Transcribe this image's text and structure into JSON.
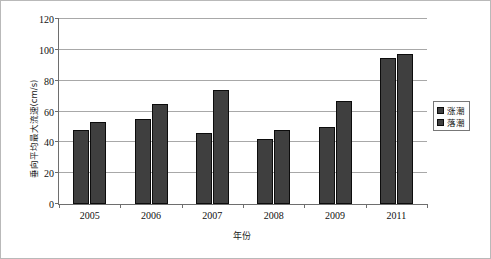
{
  "chart_data": {
    "type": "bar",
    "title": "",
    "xlabel": "年份",
    "ylabel": "垂向平均最大流速(cm/s)",
    "categories": [
      "2005",
      "2006",
      "2007",
      "2008",
      "2009",
      "2011"
    ],
    "series": [
      {
        "name": "涨潮",
        "values": [
          48,
          55,
          46,
          42,
          50,
          95
        ]
      },
      {
        "name": "落潮",
        "values": [
          53,
          65,
          74,
          48,
          67,
          97
        ]
      }
    ],
    "ylim": [
      0,
      120
    ],
    "ytick_labels": [
      "0",
      "20",
      "40",
      "60",
      "80",
      "100",
      "120"
    ],
    "ytick_values": [
      0,
      20,
      40,
      60,
      80,
      100,
      120
    ],
    "grid": "horizontal",
    "legend_position": "right",
    "colors": {
      "bar_fill": "#3f3f3f",
      "bar_edge": "#0c0c0c",
      "gridline": "#a8a8a8",
      "axis": "#6e6e6e",
      "background": "#ffffff",
      "frame": "#b9b9b9"
    }
  }
}
